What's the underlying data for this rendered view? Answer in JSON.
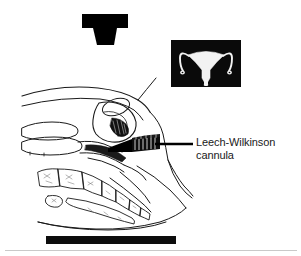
{
  "figure": {
    "name": "hysterosalpingography-diagram",
    "background_color": "#ffffff",
    "ink_color": "#000000",
    "line_color": "#1a1a1a"
  },
  "xray_tube": {
    "icon": "xray-tube-icon",
    "color": "#000000",
    "head": {
      "x": 82,
      "y": 14,
      "width": 46,
      "height": 14
    },
    "cone": {
      "top_left_x": 93,
      "top_right_x": 117,
      "bottom_left_x": 97,
      "bottom_right_x": 114,
      "top_y": 28,
      "bottom_y": 45
    }
  },
  "hsg_inset": {
    "name": "hysterosalpingogram-inset",
    "caption": "",
    "frame": {
      "x": 171,
      "y": 40,
      "width": 70,
      "height": 47
    },
    "background_color": "#0a0a0a",
    "contrast_color": "#f2f2f2",
    "contents": "uterine cavity and fallopian tubes filled with contrast medium"
  },
  "annotation": {
    "cannula_label_line1": "Leech-Wilkinson",
    "cannula_label_line2": "cannula",
    "leader_line": {
      "x1": 155,
      "y1": 144,
      "x2": 193,
      "y2": 144,
      "width": 2.6,
      "color": "#000000"
    }
  },
  "cassette": {
    "name": "xray-cassette",
    "color": "#0d0d0d",
    "rect": {
      "x": 46,
      "y": 236,
      "width": 130,
      "height": 8
    }
  },
  "divider": {
    "color": "#c9c9c9",
    "y": 250
  },
  "anatomy_parts": [
    "abdominal wall",
    "uterus",
    "bladder",
    "vagina",
    "rectum",
    "sacrum",
    "coccyx",
    "symphysis pubis"
  ]
}
